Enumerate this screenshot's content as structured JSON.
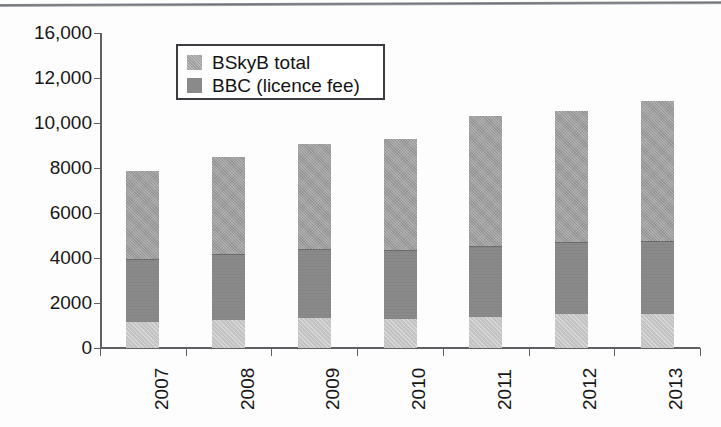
{
  "figure": {
    "bottom_caption": "",
    "background_color": "#fdfdfd",
    "rule_color": "#6e7176"
  },
  "legend": {
    "position": "inside-top-left",
    "items": [
      {
        "label": "BSkyB total",
        "color": "#9d9d9d",
        "swatch_name": "legend-swatch-bskyb"
      },
      {
        "label": "BBC (licence fee)",
        "color": "#8a8a8a",
        "swatch_name": "legend-swatch-bbc"
      }
    ]
  },
  "chart_data": {
    "type": "bar",
    "subtype": "stacked-vertical",
    "title": "",
    "xlabel": "",
    "ylabel": "",
    "categories": [
      "2007",
      "2008",
      "2009",
      "2010",
      "2011",
      "2012",
      "2013"
    ],
    "ytick_labels": [
      "16,000",
      "12,000",
      "10,000",
      "8000",
      "6000",
      "4000",
      "2000",
      "0"
    ],
    "ytick_values": [
      16000,
      12000,
      10000,
      8000,
      6000,
      4000,
      2000,
      0
    ],
    "ylim": [
      0,
      16000
    ],
    "grid": false,
    "xtick_label_rotation": -90,
    "series": [
      {
        "name": "BSkyB total",
        "color": "#9d9d9d",
        "values": [
          3950,
          4350,
          4700,
          5000,
          5800,
          5900,
          6300
        ]
      },
      {
        "name": "BBC (licence fee)",
        "color": "#8a8a8a",
        "values": [
          2750,
          2900,
          3000,
          3000,
          3100,
          3150,
          3200
        ]
      },
      {
        "name": "base segment",
        "color": "#c3c3c3",
        "values": [
          1150,
          1250,
          1350,
          1300,
          1400,
          1500,
          1500
        ]
      }
    ],
    "stack_boundaries": {
      "base_top": [
        1150,
        1250,
        1350,
        1300,
        1400,
        1500,
        1500
      ],
      "bbc_top": [
        3900,
        4150,
        4350,
        4300,
        4500,
        4650,
        4700
      ],
      "bar_total": [
        7850,
        8500,
        9050,
        9300,
        10300,
        10550,
        11000
      ]
    }
  }
}
